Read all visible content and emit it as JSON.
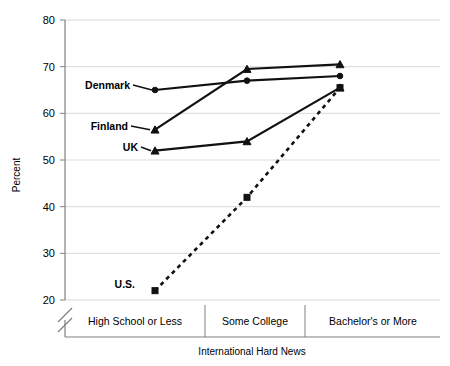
{
  "chart_data": {
    "type": "line",
    "title": "",
    "subtitle": "",
    "xlabel": "International Hard News",
    "ylabel": "Percent",
    "categories": [
      "High School or Less",
      "Some College",
      "Bachelor's or More"
    ],
    "ylim": [
      20,
      80
    ],
    "yticks": [
      20,
      30,
      40,
      50,
      60,
      70,
      80
    ],
    "ytick_labels": [
      "20",
      "30",
      "40",
      "50",
      "60",
      "70",
      "80"
    ],
    "grid": true,
    "axis_break": true,
    "legend_position": "inline-labels-left",
    "series": [
      {
        "name": "Denmark",
        "label": "Denmark",
        "marker": "circle",
        "line_style": "solid",
        "values": [
          65.0,
          67.0,
          68.0
        ]
      },
      {
        "name": "Finland",
        "label": "Finland",
        "marker": "triangle",
        "line_style": "solid",
        "values": [
          56.5,
          69.5,
          70.5
        ]
      },
      {
        "name": "UK",
        "label": "UK",
        "marker": "triangle",
        "line_style": "solid",
        "values": [
          52.0,
          54.0,
          65.5
        ]
      },
      {
        "name": "U.S.",
        "label": "U.S.",
        "marker": "square",
        "line_style": "dashed",
        "values": [
          22.0,
          42.0,
          65.5
        ]
      }
    ],
    "colors": {
      "line": "#111111",
      "grid": "#d9d9d9",
      "axis": "#808080",
      "background": "#ffffff"
    }
  }
}
